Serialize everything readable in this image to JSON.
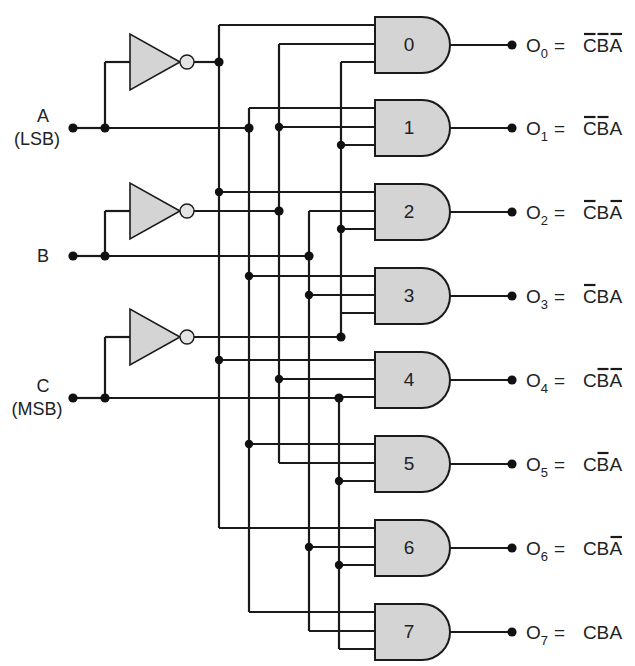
{
  "diagram": {
    "type": "3-to-8 line decoder",
    "title_fragment": "",
    "inputs": [
      {
        "name": "A",
        "note": "(LSB)",
        "y": 128
      },
      {
        "name": "B",
        "note": "",
        "y": 256
      },
      {
        "name": "C",
        "note": "(MSB)",
        "y": 398
      }
    ],
    "gates": [
      {
        "id": "0",
        "label": "0",
        "output": "O",
        "sub": "0",
        "expr": [
          "C",
          "B",
          "A"
        ],
        "bar": [
          true,
          true,
          true
        ]
      },
      {
        "id": "1",
        "label": "1",
        "output": "O",
        "sub": "1",
        "expr": [
          "C",
          "B",
          "A"
        ],
        "bar": [
          true,
          true,
          false
        ]
      },
      {
        "id": "2",
        "label": "2",
        "output": "O",
        "sub": "2",
        "expr": [
          "C",
          "B",
          "A"
        ],
        "bar": [
          true,
          false,
          true
        ]
      },
      {
        "id": "3",
        "label": "3",
        "output": "O",
        "sub": "3",
        "expr": [
          "C",
          "B",
          "A"
        ],
        "bar": [
          true,
          false,
          false
        ]
      },
      {
        "id": "4",
        "label": "4",
        "output": "O",
        "sub": "4",
        "expr": [
          "C",
          "B",
          "A"
        ],
        "bar": [
          false,
          true,
          true
        ]
      },
      {
        "id": "5",
        "label": "5",
        "output": "O",
        "sub": "5",
        "expr": [
          "C",
          "B",
          "A"
        ],
        "bar": [
          false,
          true,
          false
        ]
      },
      {
        "id": "6",
        "label": "6",
        "output": "O",
        "sub": "6",
        "expr": [
          "C",
          "B",
          "A"
        ],
        "bar": [
          false,
          false,
          true
        ]
      },
      {
        "id": "7",
        "label": "7",
        "output": "O",
        "sub": "7",
        "expr": [
          "C",
          "B",
          "A"
        ],
        "bar": [
          false,
          false,
          false
        ]
      }
    ],
    "equals": "=",
    "colors": {
      "gate_fill": "#d4d4d4",
      "line": "#1a1a1a",
      "background": "#ffffff"
    }
  }
}
